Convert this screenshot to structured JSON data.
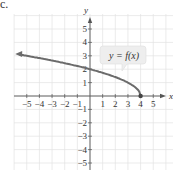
{
  "part_label": "c.",
  "chart_data": {
    "type": "line",
    "title": "",
    "function_label": "y = f(x)",
    "xlabel": "x",
    "ylabel": "y",
    "xlim": [
      -5,
      5
    ],
    "ylim": [
      -5,
      5
    ],
    "grid": true,
    "x_ticks": [
      "−5",
      "−4",
      "−3",
      "−2",
      "−1",
      "1",
      "2",
      "3",
      "4",
      "5"
    ],
    "y_ticks": [
      "5",
      "4",
      "3",
      "2",
      "1",
      "−1",
      "−2",
      "−3",
      "−4",
      "−5"
    ],
    "series": [
      {
        "name": "f(x)",
        "color": "#6b6b6b",
        "x": [
          -5.6,
          -5,
          -4,
          -3,
          -2,
          -1,
          0,
          1,
          2,
          3,
          3.5,
          3.9,
          4
        ],
        "values": [
          3.1,
          3.0,
          2.83,
          2.65,
          2.45,
          2.24,
          2.0,
          1.73,
          1.41,
          1.0,
          0.71,
          0.32,
          0
        ],
        "left_arrow": true,
        "endpoint": {
          "x": 4,
          "y": 0,
          "filled": true
        }
      }
    ],
    "colors": {
      "grid": "#e3e3e3",
      "axis": "#555555",
      "curve": "#6b6b6b",
      "label_box": "#eeeeee"
    }
  }
}
